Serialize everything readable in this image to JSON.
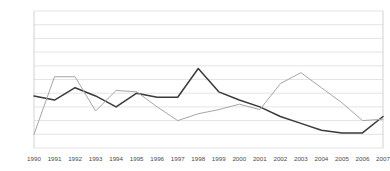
{
  "chart_data": {
    "type": "line",
    "title": "",
    "subtitle": "",
    "xlabel": "",
    "ylabel": "",
    "categories": [
      "1990",
      "1991",
      "1992",
      "1993",
      "1994",
      "1995",
      "1996",
      "1997",
      "1998",
      "1999",
      "2000",
      "2001",
      "2002",
      "2003",
      "2004",
      "2005",
      "2006",
      "2007"
    ],
    "ylim": [
      0,
      100
    ],
    "ytick_labels": [
      "0%",
      "10%",
      "20%",
      "30%",
      "40%",
      "50%",
      "60%",
      "70%",
      "80%",
      "90%",
      "100%"
    ],
    "ytick_values": [
      0,
      10,
      20,
      30,
      40,
      50,
      60,
      70,
      80,
      90,
      100
    ],
    "grid": true,
    "grid_axis": "y",
    "legend": false,
    "legend_position": "none",
    "series": [
      {
        "name": "series-1",
        "color": "#3a3a3a",
        "values": [
          38,
          35,
          44,
          38,
          30,
          40,
          37,
          37,
          58,
          41,
          35,
          30,
          23,
          18,
          13,
          11,
          11,
          23
        ]
      },
      {
        "name": "series-2",
        "color": "#a6a6a6",
        "values": [
          10,
          52,
          52,
          27,
          42,
          41,
          30,
          20,
          25,
          28,
          32,
          28,
          47,
          55,
          44,
          33,
          20,
          21
        ]
      }
    ]
  },
  "colors": {
    "grid": "#d9d9d9",
    "axis": "#bfbfbf",
    "tick_text": "#4a4a4a",
    "series_1": "#3a3a3a",
    "series_2": "#a6a6a6",
    "background": "#ffffff"
  }
}
